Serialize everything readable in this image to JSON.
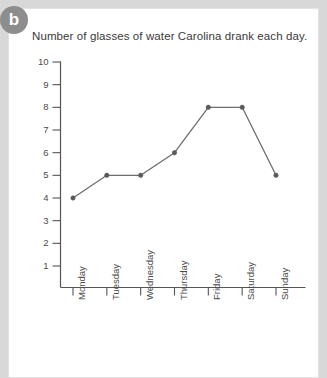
{
  "badge": {
    "label": "b"
  },
  "chart_data": {
    "type": "line",
    "title": "Number of glasses of water Carolina drank each day.",
    "xlabel": "",
    "ylabel": "",
    "categories": [
      "Monday",
      "Tuesday",
      "Wednesday",
      "Thursday",
      "Friday",
      "Saturday",
      "Sunday"
    ],
    "values": [
      4,
      5,
      5,
      6,
      8,
      8,
      5
    ],
    "yticks": [
      1,
      2,
      3,
      4,
      5,
      6,
      7,
      8,
      9,
      10
    ],
    "ylim": [
      0,
      10
    ],
    "grid": false,
    "legend": false,
    "series": [
      {
        "name": "Glasses of water",
        "values": [
          4,
          5,
          5,
          6,
          8,
          8,
          5
        ]
      }
    ],
    "colors": {
      "line": "#6e6e6e",
      "marker": "#5a5a5a",
      "axis": "#555555",
      "tick_label": "#4a4a4a",
      "title": "#3a3a3a",
      "plot_background": "#ffffff",
      "page_background": "#d8d8d8",
      "badge_background": "#8d8d8d"
    }
  }
}
